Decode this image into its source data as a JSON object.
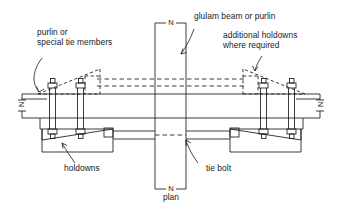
{
  "drawing": {
    "type": "engineering-detail",
    "title": "plan",
    "background": "#ffffff",
    "line_color": "#1a1a1a",
    "text_color": "#1a1a1a",
    "view_label": "plan",
    "section_marks": [
      "N",
      "N",
      "N",
      "N"
    ],
    "section_name": "N-N"
  },
  "labels": {
    "purlin": "purlin or\nspecial tie members",
    "glulam": "glulam beam or purlin",
    "additional": "additional holdowns\nwhere required",
    "holdowns": "holdowns",
    "tie_bolt": "tie bolt",
    "plan": "plan"
  },
  "section_markers": {
    "top": "N",
    "bottom": "N",
    "left": "N",
    "right": "N"
  },
  "components": [
    {
      "name": "glulam-beam",
      "orientation": "vertical",
      "style": "solid"
    },
    {
      "name": "purlin-tie-member",
      "orientation": "horizontal",
      "style": "solid"
    },
    {
      "name": "holdown-bracket-left",
      "style": "solid"
    },
    {
      "name": "holdown-bracket-right",
      "style": "solid"
    },
    {
      "name": "additional-holdown-left",
      "style": "dashed"
    },
    {
      "name": "additional-holdown-right",
      "style": "dashed"
    },
    {
      "name": "tie-bolt",
      "orientation": "horizontal",
      "style": "solid-with-hidden"
    },
    {
      "name": "upper-tie-bolt",
      "orientation": "horizontal",
      "style": "dashed"
    }
  ]
}
